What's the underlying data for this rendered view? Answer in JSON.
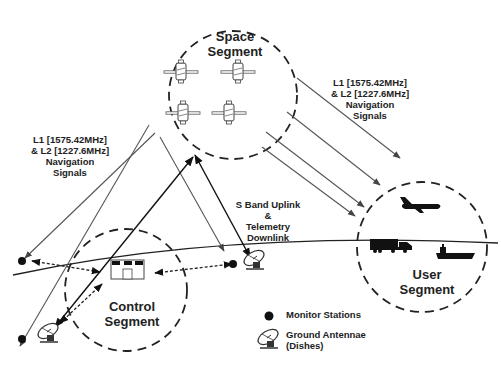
{
  "diagram": {
    "segments": {
      "space": {
        "line1": "Space",
        "line2": "Segment"
      },
      "control": {
        "line1": "Control",
        "line2": "Segment"
      },
      "user": {
        "line1": "User",
        "line2": "Segment"
      }
    },
    "signals": {
      "left": {
        "line1": "L1  [1575.42MHz]",
        "line2": "& L2  [1227.6MHz]",
        "line3": "Navigation",
        "line4": "Signals"
      },
      "right": {
        "line1": "L1  [1575.42MHz]",
        "line2": "& L2  [1227.6MHz]",
        "line3": "Navigation",
        "line4": "Signals"
      },
      "uplink": {
        "line1": "S Band Uplink",
        "line2": "&",
        "line3": "Telemetry",
        "line4": "Downlink"
      }
    },
    "legend": {
      "monitor": {
        "icon": "filled-circle",
        "label": "Monitor Stations"
      },
      "antenna": {
        "icon": "satellite-dish",
        "label1": "Ground Antennae",
        "label2": "(Dishes)"
      }
    },
    "user_vehicles": [
      "airplane",
      "truck",
      "ship"
    ],
    "satellite_count": 4,
    "colors": {
      "stroke": "#222222",
      "arrow_gray": "#555555",
      "fill": "#111111",
      "background": "#ffffff"
    }
  }
}
